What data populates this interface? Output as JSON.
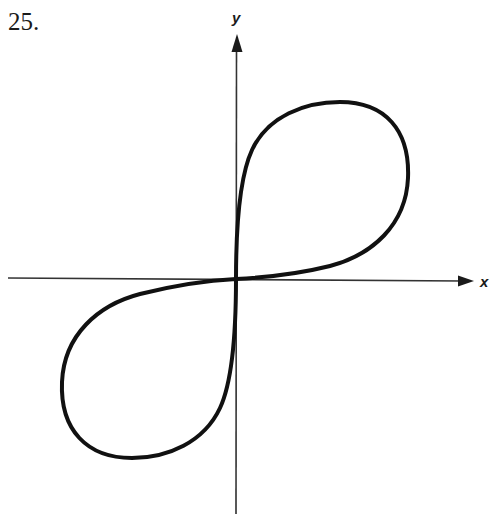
{
  "problem": {
    "number": "25."
  },
  "axes": {
    "x_label": "x",
    "y_label": "y",
    "color": "#1a1a1a"
  },
  "curve": {
    "description": "figure-eight (lemniscate-like) curve through origin with loops in quadrants I and III",
    "color": "#111111",
    "stroke_width": 4
  }
}
